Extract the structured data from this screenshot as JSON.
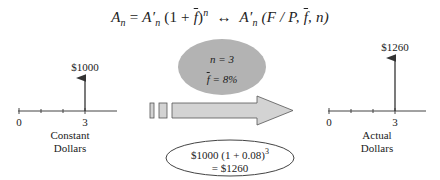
{
  "formula": {
    "lhs": "A",
    "lhs_sub": "n",
    "eq": " = ",
    "rhs1": "A′",
    "rhs1_sub": "n",
    "rhs1_paren": " (1 + ",
    "f_bar": "f",
    "rhs1_close": ")",
    "rhs1_exp": "n",
    "arrow": "  ↔  ",
    "rhs2": "A′",
    "rhs2_sub": "n",
    "rhs2_args_open": " (F / P, ",
    "rhs2_f_bar": "f",
    "rhs2_args_close": ", n)"
  },
  "left_diagram": {
    "value_label": "$1000",
    "tick_start": "0",
    "tick_end": "3",
    "caption_line1": "Constant",
    "caption_line2": "Dollars"
  },
  "middle": {
    "param_n": "n = 3",
    "param_f_symbol": "f",
    "param_f_value": " = 8%",
    "calc_line1": "$1000 (1 + 0.08)",
    "calc_exp": "3",
    "calc_line2": "= $1260"
  },
  "right_diagram": {
    "value_label": "$1260",
    "tick_start": "0",
    "tick_end": "3",
    "caption_line1": "Actual",
    "caption_line2": "Dollars"
  },
  "colors": {
    "ellipse_fill": "#b3b3b3",
    "arrow_fill": "#d3d3d3",
    "stroke": "#444444"
  }
}
